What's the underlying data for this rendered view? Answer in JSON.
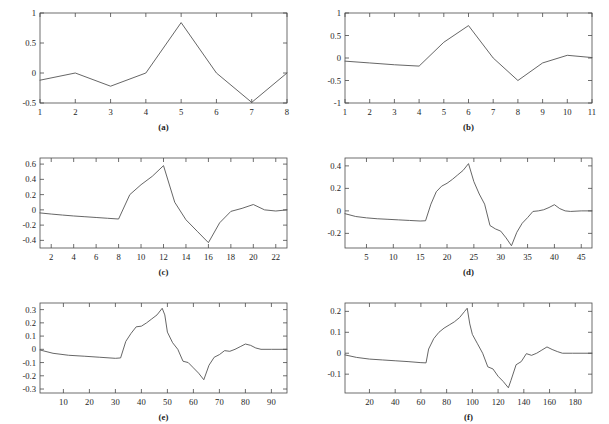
{
  "figure": {
    "background": "#ffffff",
    "line_color": "#555555",
    "axis_color": "#4a4a4a",
    "text_color": "#1c1c1c",
    "rows": 3,
    "cols": 2,
    "width": 609,
    "height": 424
  },
  "chart_data": [
    {
      "id": "a",
      "type": "line",
      "title": "",
      "caption": "(a)",
      "xlabel": "",
      "ylabel": "",
      "xlim": [
        1,
        8
      ],
      "ylim": [
        -0.5,
        1
      ],
      "grid": false,
      "legend": null,
      "xticks": [
        1,
        2,
        3,
        4,
        5,
        6,
        7,
        8
      ],
      "xticklabels": [
        "1",
        "2",
        "3",
        "4",
        "5",
        "6",
        "7",
        "8"
      ],
      "yticks": [
        -0.5,
        0,
        0.5,
        1
      ],
      "yticklabels": [
        "-0.5",
        "0",
        "0.5",
        "1"
      ],
      "x": [
        1,
        2,
        3,
        4,
        5,
        6,
        7,
        8
      ],
      "y": [
        -0.12,
        0.0,
        -0.22,
        0.0,
        0.84,
        0.0,
        -0.49,
        0.0
      ]
    },
    {
      "id": "b",
      "type": "line",
      "title": "",
      "caption": "(b)",
      "xlabel": "",
      "ylabel": "",
      "xlim": [
        1,
        11
      ],
      "ylim": [
        -1,
        1
      ],
      "grid": false,
      "legend": null,
      "xticks": [
        1,
        2,
        3,
        4,
        5,
        6,
        7,
        8,
        9,
        10,
        11
      ],
      "xticklabels": [
        "1",
        "2",
        "3",
        "4",
        "5",
        "6",
        "7",
        "8",
        "9",
        "10",
        "11"
      ],
      "yticks": [
        -1,
        -0.5,
        0,
        0.5,
        1
      ],
      "yticklabels": [
        "-1",
        "-0.5",
        "0",
        "0.5",
        "1"
      ],
      "x": [
        1,
        2,
        3,
        4,
        5,
        6,
        7,
        8,
        9,
        10,
        11
      ],
      "y": [
        -0.07,
        -0.11,
        -0.15,
        -0.18,
        0.35,
        0.72,
        0.0,
        -0.5,
        -0.11,
        0.06,
        0.01
      ]
    },
    {
      "id": "c",
      "type": "line",
      "title": "",
      "caption": "(c)",
      "xlabel": "",
      "ylabel": "",
      "xlim": [
        1,
        23
      ],
      "ylim": [
        -0.5,
        0.68
      ],
      "grid": false,
      "legend": null,
      "xticks": [
        2,
        4,
        6,
        8,
        10,
        12,
        14,
        16,
        18,
        20,
        22
      ],
      "xticklabels": [
        "2",
        "4",
        "6",
        "8",
        "10",
        "12",
        "14",
        "16",
        "18",
        "20",
        "22"
      ],
      "yticks": [
        -0.4,
        -0.2,
        0,
        0.2,
        0.4,
        0.6
      ],
      "yticklabels": [
        "-0.4",
        "-0.2",
        "0",
        "0.2",
        "0.4",
        "0.6"
      ],
      "x": [
        1,
        2,
        3,
        4,
        5,
        6,
        7,
        8,
        9,
        10,
        11,
        12,
        13,
        14,
        15,
        16,
        17,
        18,
        19,
        20,
        21,
        22,
        23
      ],
      "y": [
        -0.04,
        -0.055,
        -0.068,
        -0.08,
        -0.09,
        -0.1,
        -0.11,
        -0.12,
        0.2,
        0.33,
        0.44,
        0.58,
        0.1,
        -0.13,
        -0.28,
        -0.43,
        -0.17,
        -0.02,
        0.02,
        0.07,
        0.0,
        -0.015,
        0.0
      ]
    },
    {
      "id": "d",
      "type": "line",
      "title": "",
      "caption": "(d)",
      "xlabel": "",
      "ylabel": "",
      "xlim": [
        1,
        47
      ],
      "ylim": [
        -0.33,
        0.47
      ],
      "grid": false,
      "legend": null,
      "xticks": [
        5,
        10,
        15,
        20,
        25,
        30,
        35,
        40,
        45
      ],
      "xticklabels": [
        "5",
        "10",
        "15",
        "20",
        "25",
        "30",
        "35",
        "40",
        "45"
      ],
      "yticks": [
        -0.2,
        0,
        0.2,
        0.4
      ],
      "yticklabels": [
        "-0.2",
        "0",
        "0.2",
        "0.4"
      ],
      "x": [
        1,
        3,
        5,
        7,
        9,
        11,
        13,
        15,
        16,
        17,
        18,
        19,
        20,
        21,
        22,
        23,
        24,
        25,
        26,
        27,
        28,
        29,
        30,
        31,
        32,
        33,
        34,
        35,
        36,
        37,
        38,
        39,
        40,
        41,
        42,
        43,
        45,
        47
      ],
      "y": [
        -0.025,
        -0.05,
        -0.062,
        -0.07,
        -0.075,
        -0.08,
        -0.085,
        -0.09,
        -0.088,
        0.06,
        0.17,
        0.22,
        0.245,
        0.28,
        0.32,
        0.36,
        0.42,
        0.26,
        0.15,
        0.06,
        -0.13,
        -0.16,
        -0.18,
        -0.24,
        -0.31,
        -0.19,
        -0.11,
        -0.06,
        -0.005,
        0.0,
        0.01,
        0.03,
        0.055,
        0.02,
        0.0,
        -0.005,
        0.0,
        0.0
      ]
    },
    {
      "id": "e",
      "type": "line",
      "title": "",
      "caption": "(e)",
      "xlabel": "",
      "ylabel": "",
      "xlim": [
        1,
        96
      ],
      "ylim": [
        -0.33,
        0.35
      ],
      "grid": false,
      "legend": null,
      "xticks": [
        10,
        20,
        30,
        40,
        50,
        60,
        70,
        80,
        90
      ],
      "xticklabels": [
        "10",
        "20",
        "30",
        "40",
        "50",
        "60",
        "70",
        "80",
        "90"
      ],
      "yticks": [
        -0.3,
        -0.2,
        -0.1,
        0,
        0.1,
        0.2,
        0.3
      ],
      "yticklabels": [
        "-0.3",
        "-0.2",
        "-0.1",
        "0",
        "0.1",
        "0.2",
        "0.3"
      ],
      "x": [
        1,
        6,
        12,
        18,
        24,
        30,
        32,
        34,
        36,
        38,
        40,
        42,
        44,
        46,
        48,
        49,
        50,
        52,
        54,
        56,
        58,
        60,
        62,
        64,
        66,
        68,
        70,
        72,
        74,
        76,
        78,
        80,
        82,
        84,
        86,
        90,
        96
      ],
      "y": [
        -0.005,
        -0.03,
        -0.045,
        -0.052,
        -0.06,
        -0.068,
        -0.065,
        0.06,
        0.12,
        0.17,
        0.175,
        0.2,
        0.23,
        0.26,
        0.31,
        0.26,
        0.13,
        0.05,
        0.0,
        -0.09,
        -0.1,
        -0.14,
        -0.18,
        -0.23,
        -0.12,
        -0.06,
        -0.04,
        -0.01,
        -0.015,
        0.0,
        0.02,
        0.04,
        0.03,
        0.01,
        0.0,
        0.0,
        0.0
      ]
    },
    {
      "id": "f",
      "type": "line",
      "title": "",
      "caption": "(f)",
      "xlabel": "",
      "ylabel": "",
      "xlim": [
        1,
        193
      ],
      "ylim": [
        -0.19,
        0.24
      ],
      "grid": false,
      "legend": null,
      "xticks": [
        20,
        40,
        60,
        80,
        100,
        120,
        140,
        160,
        180
      ],
      "xticklabels": [
        "20",
        "40",
        "60",
        "80",
        "100",
        "120",
        "140",
        "160",
        "180"
      ],
      "yticks": [
        -0.1,
        0,
        0.1,
        0.2
      ],
      "yticklabels": [
        "-0.1",
        "0",
        "0.1",
        "0.2"
      ],
      "x": [
        1,
        10,
        20,
        30,
        40,
        50,
        60,
        64,
        66,
        70,
        74,
        78,
        82,
        86,
        90,
        94,
        96,
        98,
        100,
        104,
        108,
        112,
        116,
        120,
        124,
        128,
        130,
        134,
        138,
        142,
        146,
        150,
        154,
        158,
        162,
        166,
        170,
        178,
        193
      ],
      "y": [
        -0.008,
        -0.02,
        -0.028,
        -0.032,
        -0.036,
        -0.04,
        -0.045,
        -0.046,
        0.02,
        0.07,
        0.1,
        0.12,
        0.135,
        0.15,
        0.17,
        0.2,
        0.215,
        0.14,
        0.09,
        0.045,
        0.0,
        -0.065,
        -0.075,
        -0.11,
        -0.135,
        -0.165,
        -0.13,
        -0.055,
        -0.04,
        -0.002,
        -0.01,
        0.0,
        0.015,
        0.03,
        0.018,
        0.008,
        0.0,
        0.0,
        0.0
      ]
    }
  ]
}
